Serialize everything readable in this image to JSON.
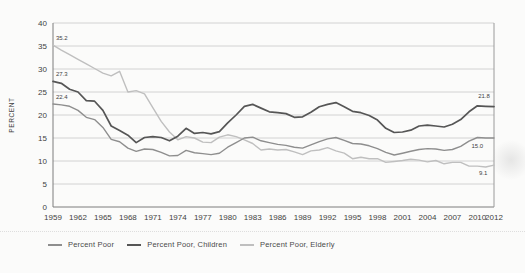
{
  "figure": {
    "y_axis_title": "PERCENT"
  },
  "chart_data": {
    "type": "line",
    "title": "",
    "xlabel": "",
    "ylabel": "PERCENT",
    "ylim": [
      0,
      40
    ],
    "yticks": [
      0,
      5,
      10,
      15,
      20,
      25,
      30,
      35,
      40
    ],
    "x_tick_labels": [
      "1959",
      "1962",
      "1965",
      "1968",
      "1971",
      "1974",
      "1977",
      "1980",
      "1983",
      "1986",
      "1989",
      "1992",
      "1995",
      "1998",
      "2001",
      "2004",
      "2007",
      "2010",
      "2012"
    ],
    "grid": "horizontal",
    "legend_position": "bottom",
    "x": [
      1959,
      1960,
      1961,
      1962,
      1963,
      1964,
      1965,
      1966,
      1967,
      1968,
      1969,
      1970,
      1971,
      1972,
      1973,
      1974,
      1975,
      1976,
      1977,
      1978,
      1979,
      1980,
      1981,
      1982,
      1983,
      1984,
      1985,
      1986,
      1987,
      1988,
      1989,
      1990,
      1991,
      1992,
      1993,
      1994,
      1995,
      1996,
      1997,
      1998,
      1999,
      2000,
      2001,
      2002,
      2003,
      2004,
      2005,
      2006,
      2007,
      2008,
      2009,
      2010,
      2011,
      2012
    ],
    "series": [
      {
        "name": "Percent Poor",
        "color": "#8e8e8e",
        "line_width": 1.4,
        "values": [
          22.4,
          22.2,
          21.9,
          21.0,
          19.5,
          19.0,
          17.3,
          14.7,
          14.2,
          12.8,
          12.1,
          12.6,
          12.5,
          11.9,
          11.1,
          11.2,
          12.3,
          11.8,
          11.6,
          11.4,
          11.7,
          13.0,
          14.0,
          15.0,
          15.2,
          14.4,
          14.0,
          13.6,
          13.4,
          13.0,
          12.8,
          13.5,
          14.2,
          14.8,
          15.1,
          14.5,
          13.8,
          13.7,
          13.3,
          12.7,
          11.9,
          11.3,
          11.7,
          12.1,
          12.5,
          12.7,
          12.6,
          12.3,
          12.5,
          13.2,
          14.3,
          15.1,
          15.0,
          15.0
        ]
      },
      {
        "name": "Percent Poor, Children",
        "color": "#565656",
        "line_width": 1.7,
        "values": [
          27.3,
          26.9,
          25.6,
          25.0,
          23.1,
          23.0,
          21.0,
          17.6,
          16.6,
          15.6,
          14.0,
          15.1,
          15.3,
          15.1,
          14.4,
          15.4,
          17.1,
          16.0,
          16.2,
          15.9,
          16.4,
          18.3,
          20.0,
          21.9,
          22.3,
          21.5,
          20.7,
          20.5,
          20.3,
          19.5,
          19.6,
          20.6,
          21.8,
          22.3,
          22.7,
          21.8,
          20.8,
          20.5,
          19.9,
          18.9,
          17.1,
          16.2,
          16.3,
          16.7,
          17.6,
          17.8,
          17.6,
          17.4,
          18.0,
          19.0,
          20.7,
          22.0,
          21.9,
          21.8
        ]
      },
      {
        "name": "Percent Poor, Elderly",
        "color": "#bfbfbf",
        "line_width": 1.4,
        "values": [
          35.2,
          34.1,
          33.1,
          32.1,
          31.1,
          30.1,
          29.1,
          28.5,
          29.5,
          25.0,
          25.3,
          24.6,
          21.6,
          18.6,
          16.3,
          14.6,
          15.3,
          15.0,
          14.1,
          14.0,
          15.2,
          15.7,
          15.3,
          14.6,
          13.8,
          12.4,
          12.6,
          12.4,
          12.5,
          12.0,
          11.4,
          12.2,
          12.4,
          12.9,
          12.2,
          11.7,
          10.5,
          10.8,
          10.5,
          10.5,
          9.7,
          9.9,
          10.1,
          10.4,
          10.2,
          9.8,
          10.1,
          9.4,
          9.7,
          9.7,
          8.9,
          8.9,
          8.7,
          9.1
        ]
      }
    ],
    "annotations": [
      {
        "text": "35.2",
        "year": 1959.35,
        "value": 35.2,
        "dy": -5
      },
      {
        "text": "27.3",
        "year": 1959.35,
        "value": 27.3,
        "dy": -5
      },
      {
        "text": "22.4",
        "year": 1959.35,
        "value": 22.4,
        "dy": -5
      },
      {
        "text": "21.8",
        "year": 2010.1,
        "value": 21.8,
        "dy": -9
      },
      {
        "text": "15.0",
        "year": 2009.3,
        "value": 15.0,
        "dy": 10
      },
      {
        "text": "9.1",
        "year": 2010.2,
        "value": 9.1,
        "dy": 10
      }
    ],
    "colors": {
      "grid": "#d2d2d2",
      "axis": "#7d7d7d",
      "text": "#3f3f3f"
    }
  }
}
